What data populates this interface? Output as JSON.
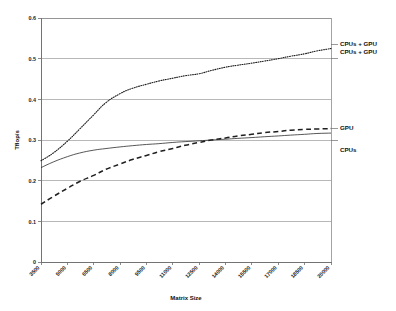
{
  "chart_data": {
    "type": "line",
    "title": "",
    "xlabel": "Matrix Size",
    "ylabel": "Tflop/s",
    "xlim": [
      3500,
      20000
    ],
    "ylim": [
      0,
      0.6
    ],
    "grid": true,
    "legend_position": "right-inline-labels",
    "x_ticks": [
      "3500",
      "5000",
      "6500",
      "8000",
      "9500",
      "11000",
      "12500",
      "14000",
      "15500",
      "17000",
      "18500",
      "20000"
    ],
    "y_ticks": [
      "0",
      "0.1",
      "0.2",
      "0.3",
      "0.4",
      "0.5",
      "0.6"
    ],
    "x": [
      3500,
      4200,
      5000,
      5700,
      6500,
      7200,
      8000,
      8700,
      9500,
      10200,
      11000,
      11700,
      12500,
      13200,
      14000,
      14700,
      15500,
      16200,
      17000,
      17700,
      18500,
      19200,
      20000
    ],
    "series": [
      {
        "name": "CPUs + GPU",
        "style": "dotted",
        "values": [
          0.249,
          0.268,
          0.297,
          0.327,
          0.362,
          0.392,
          0.414,
          0.427,
          0.437,
          0.445,
          0.452,
          0.458,
          0.463,
          0.471,
          0.479,
          0.484,
          0.489,
          0.494,
          0.5,
          0.506,
          0.512,
          0.519,
          0.525
        ]
      },
      {
        "name": "GPU",
        "style": "dashed",
        "values": [
          0.142,
          0.161,
          0.181,
          0.198,
          0.213,
          0.228,
          0.241,
          0.252,
          0.262,
          0.271,
          0.279,
          0.287,
          0.294,
          0.3,
          0.305,
          0.31,
          0.314,
          0.318,
          0.321,
          0.324,
          0.326,
          0.327,
          0.328
        ]
      },
      {
        "name": "CPUs",
        "style": "solid",
        "values": [
          0.232,
          0.246,
          0.259,
          0.268,
          0.275,
          0.279,
          0.283,
          0.286,
          0.289,
          0.291,
          0.294,
          0.296,
          0.298,
          0.3,
          0.302,
          0.304,
          0.306,
          0.308,
          0.31,
          0.312,
          0.314,
          0.316,
          0.317
        ]
      }
    ],
    "annotations": [
      {
        "text": "CPUs + GPU",
        "anchor_value": 0.525
      },
      {
        "text": "CPUs + GPU",
        "anchor_value": 0.5
      },
      {
        "text": "GPU",
        "anchor_value": 0.328
      },
      {
        "text": "CPUs",
        "anchor_value": 0.3
      }
    ]
  },
  "labels": {
    "y_0": "0",
    "y_1": "0.1",
    "y_2": "0.2",
    "y_3": "0.3",
    "y_4": "0.4",
    "y_5": "0.5",
    "y_6": "0.6",
    "x_0": "3500",
    "x_1": "5000",
    "x_2": "6500",
    "x_3": "8000",
    "x_4": "9500",
    "x_5": "11000",
    "x_6": "12500",
    "x_7": "14000",
    "x_8": "15500",
    "x_9": "17000",
    "x_10": "18500",
    "x_11": "20000",
    "x_axis_title": "Matrix Size",
    "y_axis_title": "Tflop/s",
    "legend_top_1": "CPUs + GPU",
    "legend_top_2": "CPUs + GPU",
    "legend_gpu": "GPU",
    "legend_cpus": "CPUs"
  },
  "colors": {
    "line": "#1f1f1f",
    "grid": "#9a9a9a",
    "axis": "#6e6e6e",
    "background": "#ffffff",
    "text": "#111111"
  }
}
